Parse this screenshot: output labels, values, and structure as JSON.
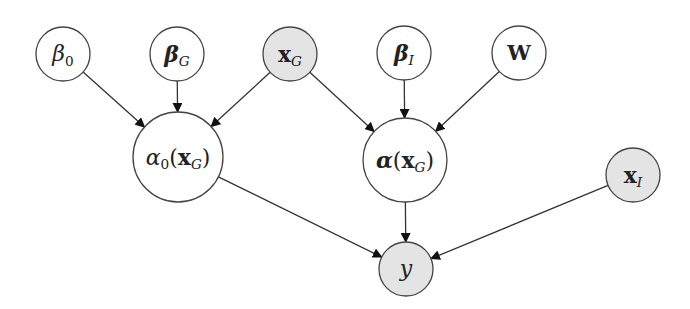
{
  "diagram": {
    "type": "probabilistic-graphical-model",
    "colors": {
      "stroke": "#444444",
      "edge": "#333333",
      "observed_fill": "#e4e4e4",
      "latent_fill": "#ffffff",
      "arrowhead": "#111111"
    },
    "nodes": [
      {
        "id": "beta0",
        "label": "β0",
        "base": "β",
        "base_style": "it",
        "sub": "0",
        "sub_style": "",
        "suffix": "",
        "cx": 63,
        "cy": 54,
        "r": 27,
        "observed": false,
        "font": 22
      },
      {
        "id": "betaG",
        "label": "βG",
        "base": "β",
        "base_style": "bfit",
        "sub": "G",
        "sub_style": "cal",
        "suffix": "",
        "cx": 177,
        "cy": 54,
        "r": 27,
        "observed": false,
        "font": 22
      },
      {
        "id": "xG",
        "label": "xG",
        "base": "x",
        "base_style": "bf",
        "sub": "G",
        "sub_style": "cal",
        "suffix": "",
        "cx": 290,
        "cy": 54,
        "r": 27,
        "observed": true,
        "font": 22
      },
      {
        "id": "betaI",
        "label": "βI",
        "base": "β",
        "base_style": "bfit",
        "sub": "I",
        "sub_style": "cal",
        "suffix": "",
        "cx": 404,
        "cy": 53,
        "r": 27,
        "observed": false,
        "font": 22
      },
      {
        "id": "W",
        "label": "W",
        "base": "W",
        "base_style": "bf",
        "sub": "",
        "sub_style": "",
        "suffix": "",
        "cx": 519,
        "cy": 53,
        "r": 27,
        "observed": false,
        "font": 21
      },
      {
        "id": "alpha0",
        "label": "α0(xG)",
        "base": "α",
        "base_style": "it",
        "sub": "0",
        "sub_style": "",
        "prefix_paren": true,
        "arg": "x",
        "arg_sub": "G",
        "cx": 178,
        "cy": 157,
        "r": 45,
        "observed": false,
        "font": 22
      },
      {
        "id": "alpha",
        "label": "α(xG)",
        "base": "α",
        "base_style": "bfit",
        "sub": "",
        "sub_style": "",
        "prefix_paren": true,
        "arg": "x",
        "arg_sub": "G",
        "cx": 405,
        "cy": 160,
        "r": 42,
        "observed": false,
        "font": 22
      },
      {
        "id": "xI",
        "label": "xI",
        "base": "x",
        "base_style": "bf",
        "sub": "I",
        "sub_style": "cal",
        "suffix": "",
        "cx": 633,
        "cy": 175,
        "r": 27,
        "observed": true,
        "font": 22
      },
      {
        "id": "y",
        "label": "y",
        "base": "y",
        "base_style": "it",
        "sub": "",
        "sub_style": "",
        "suffix": "",
        "cx": 406,
        "cy": 269,
        "r": 27,
        "observed": true,
        "font": 22
      }
    ],
    "edges": [
      {
        "from": "beta0",
        "to": "alpha0"
      },
      {
        "from": "betaG",
        "to": "alpha0"
      },
      {
        "from": "xG",
        "to": "alpha0"
      },
      {
        "from": "xG",
        "to": "alpha"
      },
      {
        "from": "betaI",
        "to": "alpha"
      },
      {
        "from": "W",
        "to": "alpha"
      },
      {
        "from": "alpha0",
        "to": "y"
      },
      {
        "from": "alpha",
        "to": "y"
      },
      {
        "from": "xI",
        "to": "y"
      }
    ]
  }
}
